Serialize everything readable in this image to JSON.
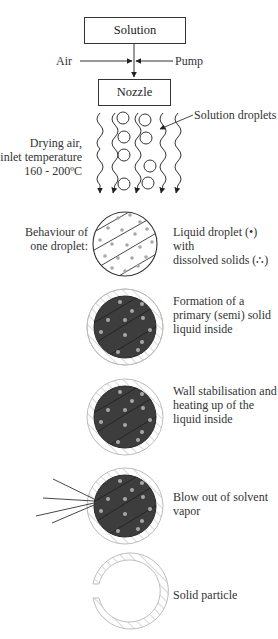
{
  "top": {
    "solution_label": "Solution",
    "air_label": "Air",
    "pump_label": "Pump",
    "nozzle_label": "Nozzle"
  },
  "spray": {
    "droplets_label": "Solution droplets",
    "drying_air": [
      "Drying air,",
      "inlet temperature",
      "160 - 200ºC"
    ]
  },
  "stages": {
    "heading": [
      "Behaviour of",
      "one droplet:"
    ],
    "items": [
      {
        "lines": [
          "Liquid droplet (•) with",
          "dissolved solids (∴)"
        ]
      },
      {
        "lines": [
          "Formation of a",
          "primary (semi) solid",
          "liquid inside"
        ]
      },
      {
        "lines": [
          "Wall stabilisation and",
          "heating up of the",
          "liquid inside"
        ]
      },
      {
        "lines": [
          "Blow out of solvent",
          "vapor"
        ]
      },
      {
        "lines": [
          "Solid particle"
        ]
      }
    ]
  },
  "colors": {
    "line": "#333333",
    "core_dark": "#3d3d3d",
    "dot": "#a8a8a8",
    "shell_hatch": "#bdbdbd"
  }
}
